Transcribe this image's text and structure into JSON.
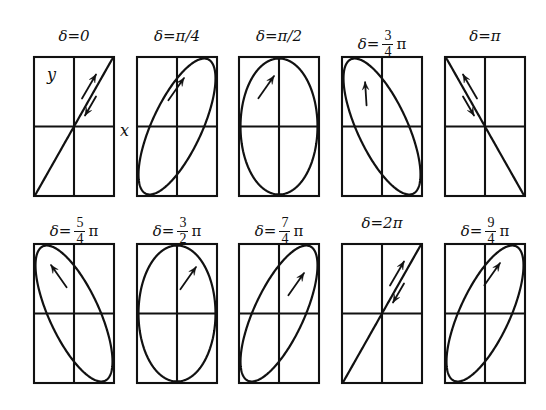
{
  "figure": {
    "title_present": false,
    "background": "#ffffff",
    "stroke_color": "#111111",
    "axis_labels": {
      "y": "y",
      "x": "x"
    },
    "rows": 2,
    "cols": 5
  },
  "chart_data": {
    "type": "line",
    "xlabel": "x",
    "ylabel": "y",
    "xlim": [
      -1,
      1
    ],
    "ylim": [
      -1,
      1
    ],
    "grid": true,
    "legend": "none",
    "panels": [
      {
        "index": 1,
        "label_text": "δ=0",
        "label_kind": "plain",
        "delta_over_pi": 0,
        "shape": "line",
        "tilt_deg": 45,
        "minor_ratio": 0.0,
        "handedness": "linear",
        "arrow": "double",
        "arrow_dirs": [
          "up-right",
          "down-left"
        ]
      },
      {
        "index": 2,
        "label_text": "δ=π/4",
        "label_kind": "plain",
        "delta_over_pi": 0.25,
        "shape": "ellipse",
        "tilt_deg": 45,
        "minor_ratio": 0.26,
        "handedness": "counterclockwise",
        "arrow": "single",
        "arrow_dirs": [
          "up-right"
        ]
      },
      {
        "index": 3,
        "label_text": "δ=π/2",
        "label_kind": "plain",
        "delta_over_pi": 0.5,
        "shape": "ellipse",
        "tilt_deg": 90,
        "minor_ratio": 1.0,
        "handedness": "counterclockwise",
        "arrow": "single",
        "arrow_dirs": [
          "up-right"
        ]
      },
      {
        "index": 4,
        "label_text": "δ=3/4 π",
        "label_kind": "fraction",
        "frac_num": "3",
        "frac_den": "4",
        "delta_over_pi": 0.75,
        "shape": "ellipse",
        "tilt_deg": -45,
        "minor_ratio": 0.42,
        "handedness": "counterclockwise",
        "arrow": "single",
        "arrow_dirs": [
          "up"
        ]
      },
      {
        "index": 5,
        "label_text": "δ=π",
        "label_kind": "plain",
        "delta_over_pi": 1.0,
        "shape": "line",
        "tilt_deg": -45,
        "minor_ratio": 0.0,
        "handedness": "linear",
        "arrow": "double",
        "arrow_dirs": [
          "up-left",
          "down-right"
        ]
      },
      {
        "index": 6,
        "label_text": "δ=5/4 π",
        "label_kind": "fraction",
        "frac_num": "5",
        "frac_den": "4",
        "delta_over_pi": 1.25,
        "shape": "ellipse",
        "tilt_deg": -45,
        "minor_ratio": 0.42,
        "handedness": "clockwise",
        "arrow": "single",
        "arrow_dirs": [
          "up-left"
        ]
      },
      {
        "index": 7,
        "label_text": "δ=3/2 π",
        "label_kind": "fraction",
        "frac_num": "3",
        "frac_den": "2",
        "delta_over_pi": 1.5,
        "shape": "ellipse",
        "tilt_deg": 90,
        "minor_ratio": 1.0,
        "handedness": "clockwise",
        "arrow": "single",
        "arrow_dirs": [
          "up-right"
        ]
      },
      {
        "index": 8,
        "label_text": "δ=7/4 π",
        "label_kind": "fraction",
        "frac_num": "7",
        "frac_den": "4",
        "delta_over_pi": 1.75,
        "shape": "ellipse",
        "tilt_deg": 45,
        "minor_ratio": 0.26,
        "handedness": "clockwise",
        "arrow": "single",
        "arrow_dirs": [
          "up-right"
        ]
      },
      {
        "index": 9,
        "label_text": "δ=2π",
        "label_kind": "plain",
        "delta_over_pi": 2.0,
        "shape": "line",
        "tilt_deg": 45,
        "minor_ratio": 0.0,
        "handedness": "linear",
        "arrow": "double",
        "arrow_dirs": [
          "up-right",
          "down-left"
        ]
      },
      {
        "index": 10,
        "label_text": "δ=9/4 π",
        "label_kind": "fraction",
        "frac_num": "9",
        "frac_den": "4",
        "delta_over_pi": 2.25,
        "shape": "ellipse",
        "tilt_deg": 45,
        "minor_ratio": 0.3,
        "handedness": "counterclockwise",
        "arrow": "single",
        "arrow_dirs": [
          "up-right"
        ]
      }
    ]
  }
}
